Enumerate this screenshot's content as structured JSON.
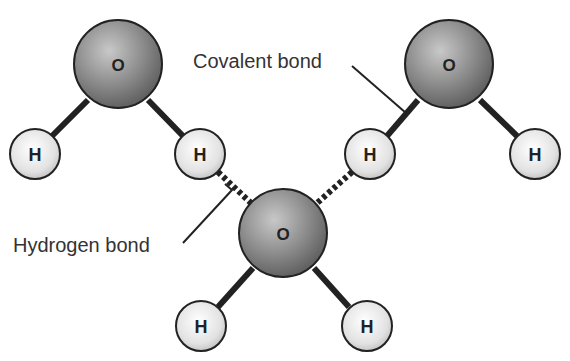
{
  "diagram": {
    "labels": {
      "covalent_bond": "Covalent bond",
      "hydrogen_bond": "Hydrogen bond"
    },
    "atoms": {
      "oxygen_symbol": "O",
      "hydrogen_symbol": "H"
    },
    "molecules": [
      {
        "name": "water-molecule-top-left",
        "oxygen": "O",
        "hydrogens": [
          "H",
          "H"
        ]
      },
      {
        "name": "water-molecule-top-right",
        "oxygen": "O",
        "hydrogens": [
          "H",
          "H"
        ]
      },
      {
        "name": "water-molecule-bottom-center",
        "oxygen": "O",
        "hydrogens": [
          "H",
          "H"
        ]
      }
    ],
    "colors": {
      "oxygen_fill": "#8a8a8a",
      "hydrogen_fill": "#e6e6e6",
      "bond": "#222222",
      "text": "#333333"
    }
  }
}
